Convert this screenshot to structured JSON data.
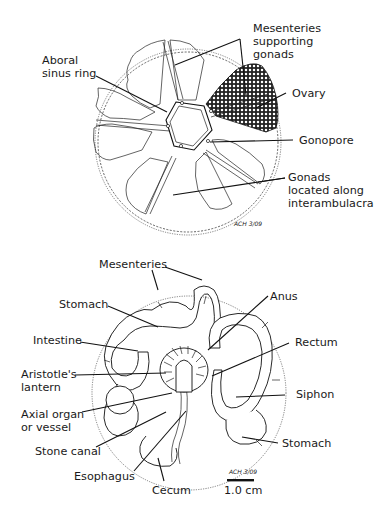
{
  "figure": {
    "top_diagram": {
      "title": "Aboral view of sea urchin interior (gonads)",
      "labels": {
        "mesenteries_1": "Mesenteries",
        "mesenteries_2": "supporting",
        "mesenteries_3": "gonads",
        "aboral_1": "Aboral",
        "aboral_2": "sinus ring",
        "ovary": "Ovary",
        "gonopore": "Gonopore",
        "gonads_1": "Gonads",
        "gonads_2": "located along",
        "gonads_3": "interambulacra"
      },
      "signature": "ACH 3/09"
    },
    "bottom_diagram": {
      "title": "Oral view of sea urchin interior (digestive tract)",
      "labels": {
        "mesenteries": "Mesenteries",
        "stomach_top": "Stomach",
        "intestine": "Intestine",
        "aristotle_1": "Aristotle's",
        "aristotle_2": "lantern",
        "axial_1": "Axial organ",
        "axial_2": "or vessel",
        "stone_canal": "Stone canal",
        "esophagus": "Esophagus",
        "cecum": "Cecum",
        "anus": "Anus",
        "rectum": "Rectum",
        "siphon": "Siphon",
        "stomach_bottom": "Stomach"
      },
      "signature": "ACH 3/09",
      "scale_bar": "1.0 cm"
    }
  }
}
